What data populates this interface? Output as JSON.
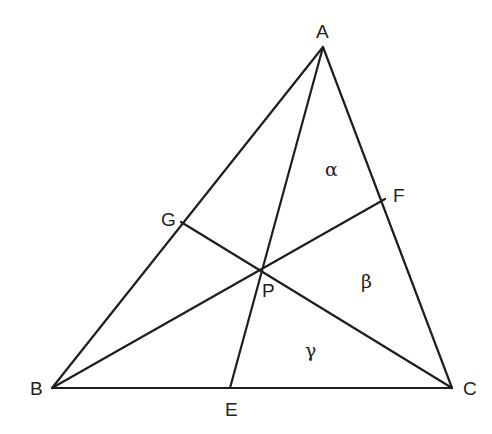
{
  "diagram": {
    "type": "triangle-cevians",
    "points": {
      "A": {
        "label": "A",
        "x": 323,
        "y": 47
      },
      "B": {
        "label": "B",
        "x": 52,
        "y": 388
      },
      "C": {
        "label": "C",
        "x": 452,
        "y": 388
      },
      "E": {
        "label": "E",
        "x": 230,
        "y": 388
      },
      "F": {
        "label": "F",
        "x": 385,
        "y": 199
      },
      "G": {
        "label": "G",
        "x": 181,
        "y": 222
      },
      "P": {
        "label": "P",
        "x": 262,
        "y": 268
      }
    },
    "segments": [
      {
        "name": "side-AB",
        "from": "A",
        "to": "B"
      },
      {
        "name": "side-BC",
        "from": "B",
        "to": "C"
      },
      {
        "name": "side-CA",
        "from": "C",
        "to": "A"
      },
      {
        "name": "cevian-AE",
        "from": "A",
        "to": "E"
      },
      {
        "name": "cevian-BF",
        "from": "B",
        "to": "F"
      },
      {
        "name": "cevian-CG",
        "from": "C",
        "to": "G"
      }
    ],
    "region_labels": {
      "alpha": "α",
      "beta": "β",
      "gamma": "γ"
    },
    "vertex_labels": {
      "A": "A",
      "B": "B",
      "C": "C",
      "E": "E",
      "F": "F",
      "G": "G",
      "P": "P"
    },
    "colors": {
      "line": "#1e1e1e",
      "text": "#222222",
      "background": "#ffffff"
    }
  }
}
